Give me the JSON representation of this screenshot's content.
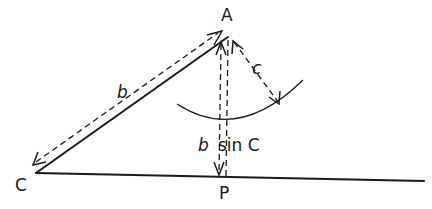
{
  "figure": {
    "points": {
      "A": "A",
      "C": "C",
      "P": "P"
    },
    "labels": {
      "side_b": "b",
      "side_c": "c",
      "altitude_b": "b",
      "altitude_sin": "sin C"
    }
  }
}
